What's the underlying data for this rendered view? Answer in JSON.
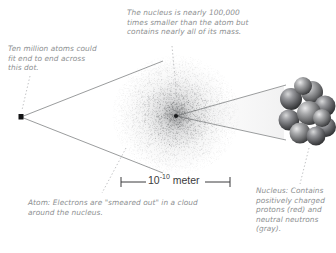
{
  "figure": {
    "background": "#ffffff",
    "text_color": "#8d8f91",
    "line_color": "#6f7173",
    "scalebar_text_color": "#3a3a3c"
  },
  "captions": {
    "nucleus_size": "The nucleus is nearly 100,000 times smaller than the atom but contains nearly all of its mass.",
    "dot": "Ten million atoms could fit end to end across this dot.",
    "atom": "Atom: Electrons are \"smeared out\" in a cloud around the nucleus.",
    "nucleus": "Nucleus: Contains positively charged protons (red) and neutral neutrons (gray)."
  },
  "scalebar": {
    "value": "10",
    "exponent": "-10",
    "unit": "meter",
    "full_label": "10-10 meter"
  },
  "icons": {
    "dot": "black-square-dot-icon",
    "electron_cloud": "electron-cloud-stipple-icon",
    "nucleus_cluster": "nucleon-sphere-cluster-icon",
    "leader_nucleus_size": "dotted-leader-icon",
    "leader_dot": "dotted-leader-icon",
    "leader_atom": "dotted-leader-icon",
    "leader_nucleus": "dotted-leader-icon",
    "cone_left": "magnification-cone-icon",
    "cone_right": "magnification-cone-icon",
    "scalebar": "scale-bar-icon"
  },
  "chart_data": {
    "type": "diagram",
    "annotations": [
      {
        "label": "Ten million atoms could fit end to end across this dot.",
        "target": "ink-dot"
      },
      {
        "label": "The nucleus is nearly 100,000 times smaller than the atom but contains nearly all of its mass.",
        "target": "nucleus"
      },
      {
        "label": "Atom: Electrons are \"smeared out\" in a cloud around the nucleus.",
        "target": "electron-cloud"
      },
      {
        "label": "Nucleus: Contains positively charged protons (red) and neutral neutrons (gray).",
        "target": "nucleon-cluster"
      }
    ],
    "scale": {
      "atom_diameter": "10^-10 meter",
      "nucleus_ratio": "100,000 times smaller"
    }
  }
}
